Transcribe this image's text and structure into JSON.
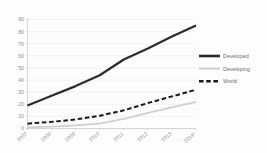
{
  "chart_data": {
    "type": "line",
    "title": "",
    "subtitle": "",
    "xlabel": "",
    "ylabel": "",
    "x": [
      "2007",
      "2008",
      "2009",
      "2010",
      "2011",
      "2012",
      "2013",
      "2014*"
    ],
    "categories": [
      "2007",
      "2008",
      "2009",
      "2010",
      "2011",
      "2012",
      "2013",
      "2014*"
    ],
    "series": [
      {
        "name": "Developed",
        "values": [
          19,
          27,
          35,
          44,
          57,
          66,
          76,
          85
        ],
        "color": "#2b2b2b",
        "style": "solid",
        "width": 2.2
      },
      {
        "name": "Developing",
        "values": [
          1,
          1.5,
          2.5,
          4,
          8,
          13,
          17.5,
          22
        ],
        "color": "#cfcfcf",
        "style": "solid",
        "width": 1.8
      },
      {
        "name": "World",
        "values": [
          4,
          5.5,
          7.5,
          10.5,
          15,
          21,
          26.5,
          32
        ],
        "color": "#1a1a1a",
        "style": "dashed",
        "width": 2.0
      }
    ],
    "ylim": [
      0,
      90
    ],
    "ytick_values": [
      0,
      10,
      20,
      30,
      40,
      50,
      60,
      70,
      80,
      90
    ],
    "ytick_labels": [
      "0",
      "10",
      "20",
      "30",
      "40",
      "50",
      "60",
      "70",
      "80",
      "90"
    ],
    "grid": true,
    "grid_axis": "y",
    "legend_position": "right",
    "legend_entries": [
      "Developed",
      "Developing",
      "World"
    ],
    "background_color": "#fdfdfd",
    "grid_color": "#e9e9e9",
    "axis_color": "#c9c9c9",
    "tick_label_color": "#8d8d8d",
    "xtick_rotation_deg": -40
  }
}
